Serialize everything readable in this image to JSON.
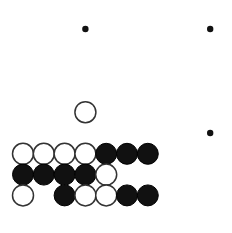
{
  "figure": {
    "kind": "go-board-diagram",
    "board_colors": {
      "background": "#ffffff",
      "grid_line": "#595959",
      "edge_line": "#1a1a1a",
      "black_stone": "#111111",
      "white_stone": "#ffffff",
      "white_stone_outline": "#333333",
      "star_point": "#111111"
    }
  },
  "chart_data": {
    "type": "table",
    "xlabel": "",
    "ylabel": "",
    "grid": true,
    "geometry": {
      "origin_x": 23,
      "origin_y": 29,
      "spacing": 20.8,
      "columns": 10,
      "rows": 10,
      "stone_radius": 10.5,
      "left_edge_x": 23,
      "bottom_edge_y": 216
    },
    "edges": [
      "left",
      "bottom"
    ],
    "star_points": [
      {
        "col": 4,
        "row": 1
      },
      {
        "col": 10,
        "row": 1
      },
      {
        "col": 10,
        "row": 6
      }
    ],
    "stones": [
      {
        "col": 4,
        "row": 5,
        "color": "white"
      },
      {
        "col": 1,
        "row": 7,
        "color": "white"
      },
      {
        "col": 2,
        "row": 7,
        "color": "white"
      },
      {
        "col": 3,
        "row": 7,
        "color": "white"
      },
      {
        "col": 4,
        "row": 7,
        "color": "white"
      },
      {
        "col": 5,
        "row": 7,
        "color": "black"
      },
      {
        "col": 6,
        "row": 7,
        "color": "black"
      },
      {
        "col": 7,
        "row": 7,
        "color": "black"
      },
      {
        "col": 1,
        "row": 8,
        "color": "black"
      },
      {
        "col": 2,
        "row": 8,
        "color": "black"
      },
      {
        "col": 3,
        "row": 8,
        "color": "black"
      },
      {
        "col": 4,
        "row": 8,
        "color": "black"
      },
      {
        "col": 5,
        "row": 8,
        "color": "white"
      },
      {
        "col": 1,
        "row": 9,
        "color": "white"
      },
      {
        "col": 3,
        "row": 9,
        "color": "black"
      },
      {
        "col": 4,
        "row": 9,
        "color": "white"
      },
      {
        "col": 5,
        "row": 9,
        "color": "white"
      },
      {
        "col": 6,
        "row": 9,
        "color": "black"
      },
      {
        "col": 7,
        "row": 9,
        "color": "black"
      }
    ],
    "empty_marked_points": [
      {
        "col": 2,
        "row": 9
      }
    ],
    "counts": {
      "black_stones": 12,
      "white_stones": 11,
      "total_stones": 23
    }
  }
}
